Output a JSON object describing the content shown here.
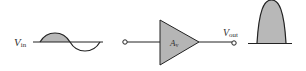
{
  "diagram": {
    "input": {
      "label": "V",
      "subscript": "in"
    },
    "amplifier": {
      "label": "A",
      "subscript": "v"
    },
    "output": {
      "label": "V",
      "subscript": "out"
    },
    "colors": {
      "stroke": "#222222",
      "fill": "#b8b8b8",
      "amp_fill": "#b5b5b5",
      "text": "#333333"
    }
  }
}
